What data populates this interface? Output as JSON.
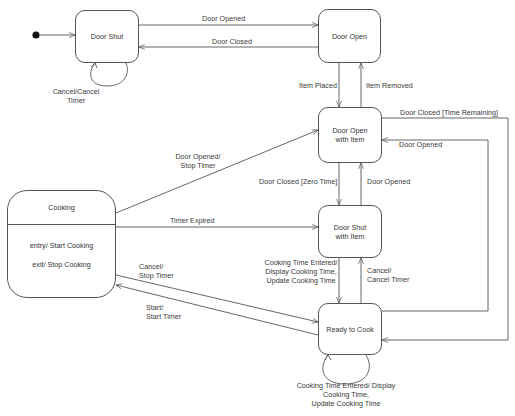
{
  "diagram": {
    "type": "uml-state-machine",
    "initial_state": "Door Shut",
    "states": [
      {
        "id": "door_shut",
        "label_lines": [
          "Door Shut"
        ]
      },
      {
        "id": "door_open",
        "label_lines": [
          "Door Open"
        ]
      },
      {
        "id": "door_open_item",
        "label_lines": [
          "Door Open",
          "with Item"
        ]
      },
      {
        "id": "door_shut_item",
        "label_lines": [
          "Door Shut",
          "with Item"
        ]
      },
      {
        "id": "ready_to_cook",
        "label_lines": [
          "Ready to Cook"
        ]
      },
      {
        "id": "cooking",
        "label_lines": [
          "Cooking"
        ],
        "activities": [
          "entry/ Start Cooking",
          "exit/ Stop Cooking"
        ]
      }
    ],
    "transitions": [
      {
        "from": "door_shut",
        "to": "door_open",
        "label": "Door Opened"
      },
      {
        "from": "door_open",
        "to": "door_shut",
        "label": "Door Closed"
      },
      {
        "from": "door_shut",
        "to": "door_shut",
        "label_lines": [
          "Cancel/Cancel",
          "Timer"
        ]
      },
      {
        "from": "door_open",
        "to": "door_open_item",
        "label": "Item Placed"
      },
      {
        "from": "door_open_item",
        "to": "door_open",
        "label": "Item Removed"
      },
      {
        "from": "door_open_item",
        "to": "ready_to_cook",
        "label": "Door Closed [Time Remaining]"
      },
      {
        "from": "ready_to_cook",
        "to": "door_open_item",
        "label": "Door Opened"
      },
      {
        "from": "cooking",
        "to": "door_open_item",
        "label_lines": [
          "Door Opened/",
          "Stop Timer"
        ]
      },
      {
        "from": "door_open_item",
        "to": "door_shut_item",
        "label": "Door Closed [Zero Time]"
      },
      {
        "from": "door_shut_item",
        "to": "door_open_item",
        "label": "Door Opened"
      },
      {
        "from": "cooking",
        "to": "door_shut_item",
        "label": "Timer Expired"
      },
      {
        "from": "door_shut_item",
        "to": "ready_to_cook",
        "label_lines": [
          "Cooking Time Entered/",
          "Display Cooking Time,",
          "Update Cooking Time"
        ]
      },
      {
        "from": "ready_to_cook",
        "to": "door_shut_item",
        "label_lines": [
          "Cancel/",
          "Cancel Timer"
        ]
      },
      {
        "from": "cooking",
        "to": "ready_to_cook",
        "label_lines": [
          "Cancel/",
          "Stop Timer"
        ]
      },
      {
        "from": "ready_to_cook",
        "to": "cooking",
        "label_lines": [
          "Start/",
          "Start Timer"
        ]
      },
      {
        "from": "ready_to_cook",
        "to": "ready_to_cook",
        "label_lines": [
          "Cooking Time Entered/ Display",
          "Cooking Time,",
          "Update Cooking Time"
        ]
      }
    ]
  },
  "labels": {
    "door_shut": "Door Shut",
    "door_open": "Door Open",
    "door_open_item_1": "Door Open",
    "door_open_item_2": "with Item",
    "door_shut_item_1": "Door Shut",
    "door_shut_item_2": "with Item",
    "ready_to_cook": "Ready to Cook",
    "cooking": "Cooking",
    "cooking_entry": "entry/ Start Cooking",
    "cooking_exit": "exit/ Stop Cooking",
    "t_door_opened_top": "Door Opened",
    "t_door_closed_top": "Door Closed",
    "t_cancel_1": "Cancel/Cancel",
    "t_cancel_2": "Timer",
    "t_item_placed": "Item Placed",
    "t_item_removed": "Item Removed",
    "t_closed_time_remaining": "Door Closed [Time Remaining]",
    "t_door_opened_right": "Door Opened",
    "t_opened_stop_1": "Door Opened/",
    "t_opened_stop_2": "Stop Timer",
    "t_closed_zero": "Door Closed [Zero Time]",
    "t_door_opened_mid": "Door Opened",
    "t_timer_expired": "Timer Expired",
    "t_cte_1": "Cooking Time Entered/",
    "t_cte_2": "Display Cooking Time,",
    "t_cte_3": "Update Cooking Time",
    "t_cancel_cancel_1": "Cancel/",
    "t_cancel_cancel_2": "Cancel Timer",
    "t_cancel_stop_1": "Cancel/",
    "t_cancel_stop_2": "Stop Timer",
    "t_start_1": "Start/",
    "t_start_2": "Start Timer",
    "t_self_1": "Cooking Time Entered/ Display",
    "t_self_2": "Cooking Time,",
    "t_self_3": "Update Cooking Time"
  },
  "colors": {
    "line": "#555555",
    "text": "#333333",
    "background": "#ffffff"
  }
}
